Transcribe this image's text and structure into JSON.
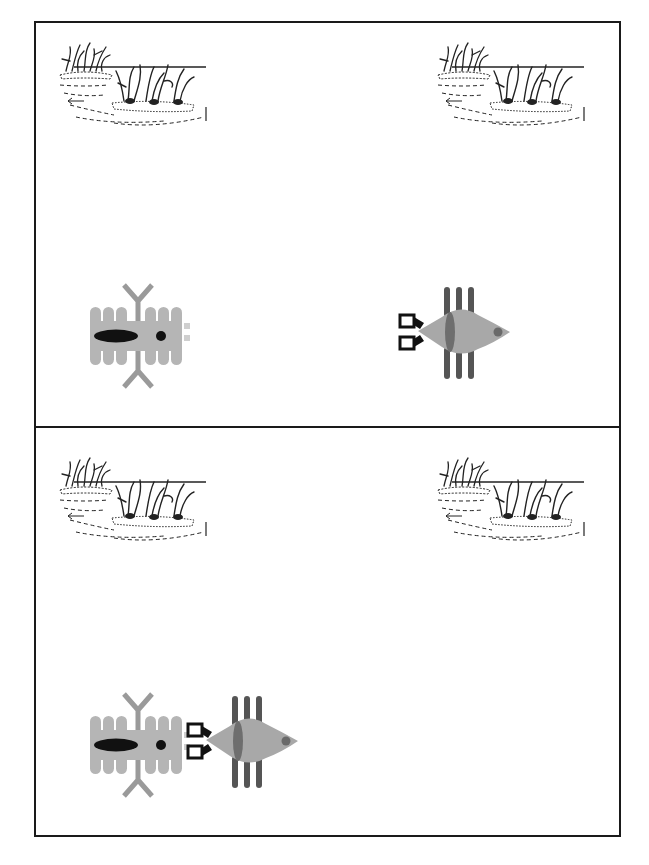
{
  "diagram": {
    "type": "illustration",
    "panels": [
      {
        "id": "top",
        "scenes": [
          "marsh-reeds-left",
          "marsh-reeds-right"
        ],
        "creatures": [
          {
            "kind": "larva",
            "position": "left"
          },
          {
            "kind": "fish",
            "position": "right",
            "facing": "left"
          }
        ]
      },
      {
        "id": "bottom",
        "scenes": [
          "marsh-reeds-left",
          "marsh-reeds-right"
        ],
        "creatures": [
          {
            "kind": "larva",
            "position": "left"
          },
          {
            "kind": "fish",
            "position": "adjacent-to-larva",
            "facing": "left"
          }
        ]
      }
    ]
  },
  "colors": {
    "border": "#1a1a1a",
    "larva_body": "#b5b5b5",
    "larva_marks": "#111111",
    "larva_antenna": "#9a9a9a",
    "fish_body": "#a8a8a8",
    "fish_fins": "#555555",
    "fish_stripe": "#6e6e6e",
    "fish_eye": "#6a6a6a",
    "fish_mouthparts": "#111111",
    "reeds": "#222222"
  }
}
